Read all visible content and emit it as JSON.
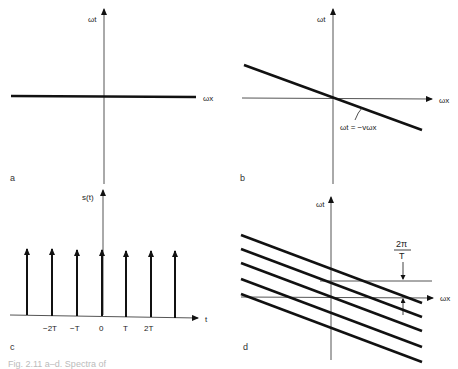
{
  "figure": {
    "caption": "Fig. 2.11 a–d. Spectra of",
    "panels": {
      "a": {
        "label": "a",
        "y_axis": "ωt",
        "x_axis": "ωx",
        "description": "Horizontal line along ωx axis"
      },
      "b": {
        "label": "b",
        "y_axis": "ωt",
        "x_axis": "ωx",
        "line_equation": "ωt = −vωx",
        "description": "Line through origin with negative slope"
      },
      "c": {
        "label": "c",
        "y_axis": "s(t)",
        "x_axis": "t",
        "ticks": [
          "−2T",
          "−T",
          "0",
          "T",
          "2T"
        ],
        "impulse_count": 7,
        "description": "Impulse train with period T"
      },
      "d": {
        "label": "d",
        "y_axis": "ωt",
        "x_axis": "ωx",
        "spacing_label_num": "2π",
        "spacing_label_den": "T",
        "line_count": 5,
        "description": "Replicated spectral lines spaced 2π/T"
      }
    }
  },
  "colors": {
    "ink": "#111111",
    "axis": "#444444",
    "background": "#ffffff"
  }
}
